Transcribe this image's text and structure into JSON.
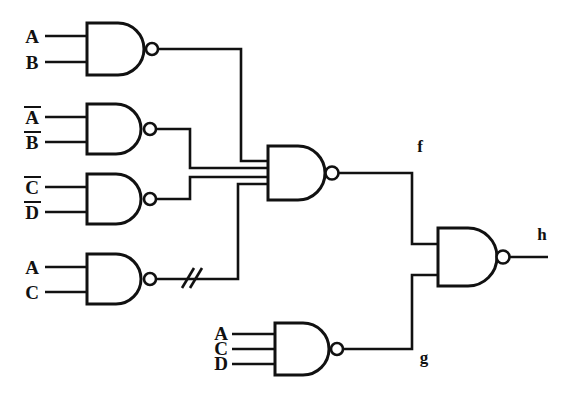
{
  "diagram": {
    "type": "logic-circuit-schematic",
    "background_color": "#ffffff",
    "line_color": "#111111",
    "width": 577,
    "height": 411
  },
  "inputs": {
    "g1_a": "A",
    "g1_b": "B",
    "g2_a": "A",
    "g2_b": "B",
    "g3_c": "C",
    "g3_d": "D",
    "g4_a": "A",
    "g4_c": "C",
    "g6_a": "A",
    "g6_c": "C",
    "g6_d": "D"
  },
  "outputs": {
    "f": "f",
    "g": "g",
    "h": "h"
  },
  "gates": [
    {
      "id": "gate-ab",
      "name": "nand-gate-ab",
      "kind": "NAND",
      "input_count": 2,
      "input_labels": [
        "A",
        "B"
      ],
      "input_overbars": [
        false,
        false
      ]
    },
    {
      "id": "gate-nanb",
      "name": "nand-gate-a-bar-b-bar",
      "kind": "NAND",
      "input_count": 2,
      "input_labels": [
        "A",
        "B"
      ],
      "input_overbars": [
        true,
        true
      ]
    },
    {
      "id": "gate-ncnd",
      "name": "nand-gate-c-bar-d-bar",
      "kind": "NAND",
      "input_count": 2,
      "input_labels": [
        "C",
        "D"
      ],
      "input_overbars": [
        true,
        true
      ]
    },
    {
      "id": "gate-ac",
      "name": "nand-gate-ac",
      "kind": "NAND",
      "input_count": 2,
      "input_labels": [
        "A",
        "C"
      ],
      "input_overbars": [
        false,
        false
      ]
    },
    {
      "id": "gate-f",
      "name": "nand-gate-f",
      "kind": "NAND",
      "input_count": 4,
      "input_labels": [],
      "output_label": "f"
    },
    {
      "id": "gate-g",
      "name": "nand-gate-acd",
      "kind": "NAND",
      "input_count": 3,
      "input_labels": [
        "A",
        "C",
        "D"
      ],
      "input_overbars": [
        false,
        false,
        false
      ],
      "output_label": "g"
    },
    {
      "id": "gate-h",
      "name": "nand-gate-h",
      "kind": "NAND",
      "input_count": 2,
      "input_labels": [],
      "output_label": "h"
    }
  ],
  "annotations": {
    "wire_break_marks": "//"
  }
}
